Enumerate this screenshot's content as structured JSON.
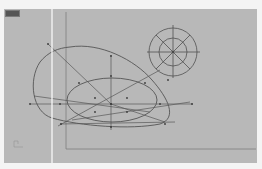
{
  "viewport": {
    "label": "",
    "background": "#b8b8b8",
    "curve_color": "#5a5a5a",
    "axis_color": "#7d7d7d",
    "cursor_line_color": "#f2f2f2"
  },
  "icons": {
    "axis_gizmo": "world-axis-icon",
    "target": "circle-crosshair-icon"
  }
}
